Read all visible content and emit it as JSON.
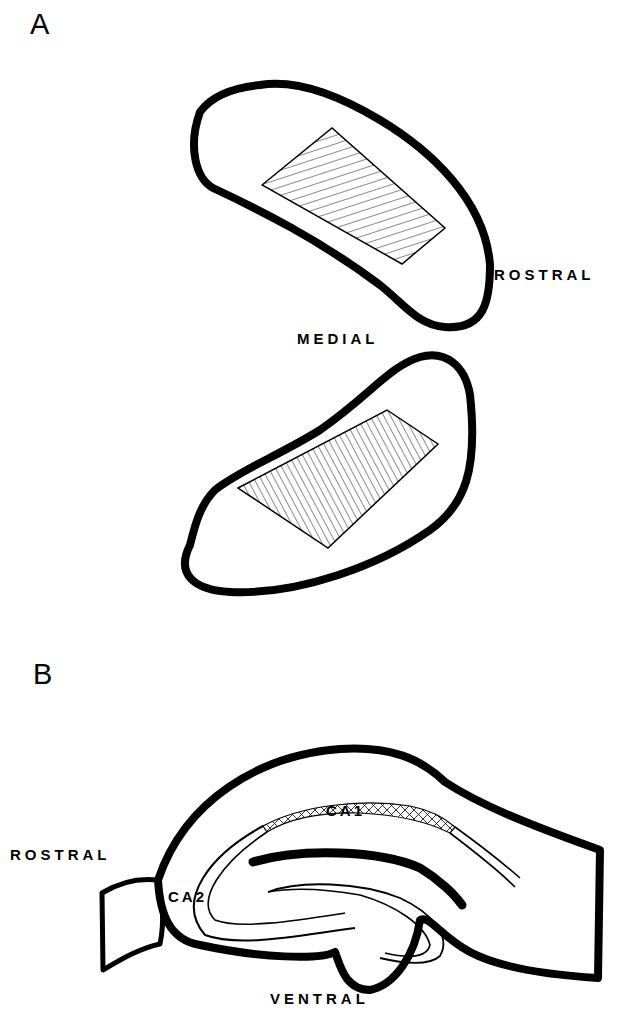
{
  "figure": {
    "panel_a": {
      "label": "A",
      "orientation_labels": {
        "rostral": "ROSTRAL",
        "medial": "MEDIAL"
      }
    },
    "panel_b": {
      "label": "B",
      "orientation_labels": {
        "rostral": "ROSTRAL",
        "ventral": "VENTRAL"
      },
      "region_labels": {
        "ca1": "CA1",
        "ca2": "CA2"
      }
    }
  }
}
